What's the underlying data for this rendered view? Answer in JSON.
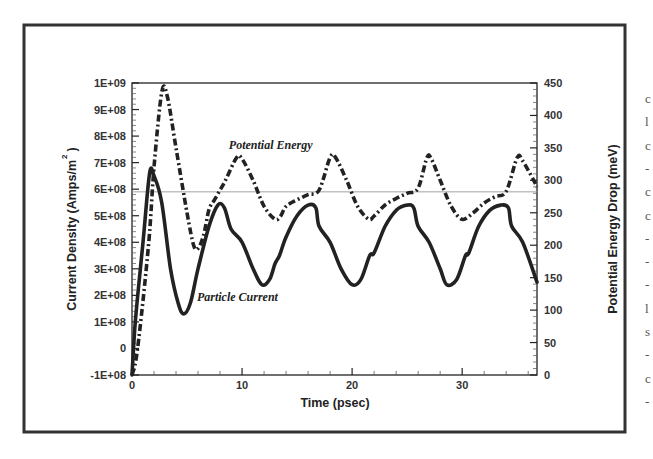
{
  "chart_data": {
    "type": "line",
    "title": "",
    "xlabel": "Time (psec)",
    "ylabel": "Current Density (Amps/m 2 )",
    "ylabel_parts": {
      "main": "Current Density (Amps/m",
      "sup": "2",
      "close": ")"
    },
    "y2label": "Potential Energy Drop (meV)",
    "xlim": [
      0,
      36.8
    ],
    "ylim": [
      -100000000,
      1000000000
    ],
    "y2lim": [
      0,
      450
    ],
    "x_ticks": [
      0,
      10,
      20,
      30
    ],
    "x_tick_labels": [
      "0",
      "10",
      "20",
      "30"
    ],
    "y_ticks": [
      -100000000,
      0,
      100000000,
      200000000,
      300000000,
      400000000,
      500000000,
      600000000,
      700000000,
      800000000,
      900000000,
      1000000000
    ],
    "y_tick_labels": [
      "-1E+08",
      "0",
      "1E+08",
      "2E+08",
      "3E+08",
      "4E+08",
      "5E+08",
      "6E+08",
      "7E+08",
      "8E+08",
      "9E+08",
      "1E+09"
    ],
    "y2_ticks": [
      0,
      50,
      100,
      150,
      200,
      250,
      300,
      350,
      400,
      450
    ],
    "y2_tick_labels": [
      "0",
      "50",
      "100",
      "150",
      "200",
      "250",
      "300",
      "350",
      "400",
      "450"
    ],
    "reference_line": {
      "y": 590000000,
      "y2_equiv_meV": 288,
      "style": "thin gray horizontal"
    },
    "grid": false,
    "legend": "inline annotations",
    "annotations": [
      {
        "text": "Potential Energy",
        "x": 8.8,
        "y": 750000000
      },
      {
        "text": "Particle Current",
        "x": 5.9,
        "y": 180000000
      }
    ],
    "series": [
      {
        "name": "Particle Current",
        "axis": "left",
        "style": "solid",
        "units": "Amps/m^2",
        "x": [
          0,
          0.3,
          1,
          1.6,
          2,
          2.7,
          3.5,
          4.2,
          4.7,
          5.3,
          6,
          7,
          7.8,
          8.4,
          9,
          10,
          11,
          11.8,
          12.5,
          13,
          13.4,
          14,
          15,
          16,
          16.7,
          17,
          18,
          19,
          20,
          20.8,
          21.6,
          22,
          23,
          24,
          25,
          25.6,
          26,
          27,
          28,
          28.6,
          29.5,
          30.3,
          30.6,
          31.5,
          32.5,
          33.5,
          34.2,
          34.5,
          35.5,
          36.8
        ],
        "values": [
          -100000000,
          100000000,
          400000000,
          660000000,
          650000000,
          550000000,
          300000000,
          170000000,
          130000000,
          170000000,
          300000000,
          460000000,
          540000000,
          530000000,
          450000000,
          400000000,
          300000000,
          240000000,
          260000000,
          320000000,
          350000000,
          420000000,
          500000000,
          540000000,
          530000000,
          460000000,
          400000000,
          300000000,
          240000000,
          260000000,
          350000000,
          360000000,
          460000000,
          520000000,
          540000000,
          530000000,
          460000000,
          400000000,
          300000000,
          240000000,
          260000000,
          350000000,
          360000000,
          460000000,
          520000000,
          540000000,
          530000000,
          460000000,
          400000000,
          250000000
        ]
      },
      {
        "name": "Potential Energy",
        "axis": "right",
        "style": "dash-dot",
        "units": "meV",
        "x": [
          0,
          0.5,
          1.5,
          2,
          2.7,
          3.2,
          4,
          5,
          5.6,
          6,
          6.5,
          7,
          7.5,
          8,
          8.5,
          9.5,
          10,
          11,
          12,
          13,
          13.5,
          14,
          15,
          16,
          17,
          18,
          18.5,
          19.5,
          20.5,
          21.5,
          22,
          23,
          24,
          25,
          26,
          26.8,
          27.2,
          28,
          29,
          30,
          31,
          32,
          33,
          34,
          35,
          35.5,
          36.5,
          36.8
        ],
        "values": [
          0,
          40,
          200,
          320,
          435,
          430,
          350,
          250,
          200,
          195,
          215,
          255,
          270,
          285,
          300,
          335,
          333,
          300,
          260,
          240,
          245,
          260,
          270,
          278,
          285,
          335,
          335,
          300,
          260,
          240,
          245,
          262,
          272,
          280,
          288,
          335,
          333,
          300,
          260,
          240,
          250,
          265,
          275,
          283,
          335,
          330,
          300,
          290
        ]
      }
    ]
  },
  "edge_text": {
    "chars": [
      "c",
      "l",
      "c",
      "-",
      "c",
      "c",
      "-",
      "-",
      "-",
      "l",
      "s",
      "-",
      "c",
      "-"
    ]
  },
  "colors": {
    "line": "#222222",
    "frame": "#333333",
    "reference_line": "#999999",
    "text": "#333333"
  }
}
